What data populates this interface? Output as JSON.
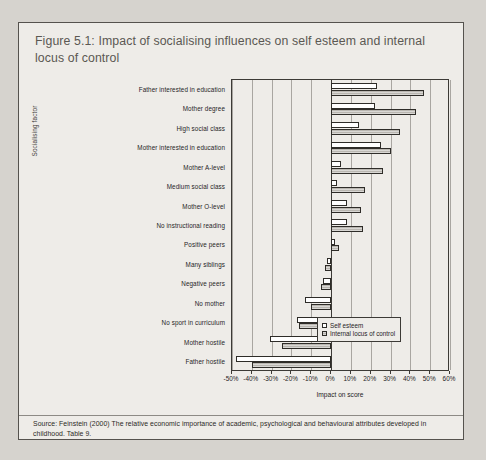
{
  "figure": {
    "title": "Figure 5.1: Impact of socialising influences on self esteem and internal locus of control",
    "source_note": "Source: Feinstein (2000) The relative economic importance of academic, psychological and behavioural attributes developed in childhood. Table 9.",
    "method_note": "Note: Impact on score reported as proportion of one standard deviation. Typically, an improvement of one standard deviation is equivalent to moving from 50th place out of 100 to 16th place."
  },
  "legend": {
    "position": "inside-bottom-right",
    "items": [
      {
        "label": "Self esteem",
        "key": "self_esteem"
      },
      {
        "label": "Internal locus of control",
        "key": "internal_locus_of_control"
      }
    ]
  },
  "chart_data": {
    "type": "bar",
    "orientation": "horizontal",
    "title": "Impact of socialising influences on self esteem and internal locus of control",
    "xlabel": "Impact on score",
    "ylabel": "Socialising factor",
    "xlim": [
      -50,
      60
    ],
    "xticks": [
      -50,
      -40,
      -30,
      -20,
      -10,
      0,
      10,
      20,
      30,
      40,
      50,
      60
    ],
    "xticklabels": [
      "-50%",
      "-40%",
      "-30%",
      "-20%",
      "-10%",
      "0%",
      "10%",
      "20%",
      "30%",
      "40%",
      "50%",
      "60%"
    ],
    "grid": "vertical",
    "units": "percent of one standard deviation",
    "categories": [
      "Father interested in education",
      "Mother degree",
      "High social class",
      "Mother interested in education",
      "Mother A-level",
      "Medium social class",
      "Mother O-level",
      "No instructional reading",
      "Positive peers",
      "Many siblings",
      "Negative peers",
      "No mother",
      "No sport in curriculum",
      "Mother hostile",
      "Father hostile"
    ],
    "series": [
      {
        "name": "Self esteem",
        "values": [
          23,
          22,
          14,
          25,
          5,
          3,
          8,
          8,
          2,
          -2,
          -4,
          -13,
          -17,
          -31,
          -48
        ]
      },
      {
        "name": "Internal locus of control",
        "values": [
          47,
          43,
          35,
          30,
          26,
          17,
          15,
          16,
          4,
          -3,
          -5,
          -10,
          -16,
          -25,
          -40
        ]
      }
    ]
  }
}
